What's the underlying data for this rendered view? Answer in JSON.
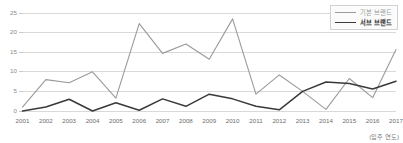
{
  "chart_data": {
    "type": "line",
    "title": "",
    "subtitle": "",
    "xlabel": "(입주 연도)",
    "ylabel": "",
    "categories": [
      "2001",
      "2002",
      "2003",
      "2004",
      "2005",
      "2006",
      "2007",
      "2008",
      "2009",
      "2010",
      "2011",
      "2012",
      "2013",
      "2014",
      "2015",
      "2016",
      "2017"
    ],
    "x": [
      2001,
      2002,
      2003,
      2004,
      2005,
      2006,
      2007,
      2008,
      2009,
      2010,
      2011,
      2012,
      2013,
      2014,
      2015,
      2016,
      2017
    ],
    "series": [
      {
        "name": "기본 브랜드",
        "color": "#9a9a9a",
        "width": 1.1,
        "values": [
          1.0,
          8.0,
          7.2,
          10.0,
          3.3,
          22.3,
          14.7,
          17.1,
          13.2,
          23.5,
          4.3,
          9.2,
          5.0,
          0.4,
          8.3,
          3.4,
          15.7
        ]
      },
      {
        "name": "서브 브랜드",
        "color": "#3a3a3a",
        "width": 1.5,
        "values": [
          0.0,
          1.0,
          3.0,
          0.0,
          2.1,
          0.2,
          3.1,
          1.2,
          4.3,
          3.1,
          1.2,
          0.3,
          5.0,
          7.4,
          7.0,
          5.6,
          7.6
        ]
      }
    ],
    "ylim": [
      0,
      25
    ],
    "yticks": [
      0,
      5,
      10,
      15,
      20,
      25
    ],
    "ytick_labels": [
      "0",
      "5",
      "10",
      "15",
      "20",
      "25"
    ],
    "xlim": [
      2001,
      2017
    ],
    "grid": true,
    "grid_axis": "y",
    "grid_color": "#c9c9c9",
    "legend_position": "top-right",
    "background": "#ffffff"
  },
  "legend": {
    "items": [
      {
        "label": "기본 브랜드",
        "color": "#9a9a9a",
        "thickness": "1.1px",
        "bold": false
      },
      {
        "label": "서브 브랜드",
        "color": "#3a3a3a",
        "thickness": "1.6px",
        "bold": true
      }
    ]
  },
  "caption": {
    "text": "(입주 연도)"
  }
}
